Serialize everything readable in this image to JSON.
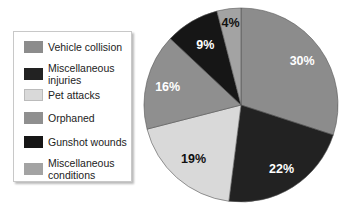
{
  "chart_data": {
    "type": "pie",
    "title": "",
    "categories": [
      "Vehicle collision",
      "Miscellaneous injuries",
      "Pet attacks",
      "Orphaned",
      "Gunshot wounds",
      "Miscellaneous conditions"
    ],
    "values": [
      30,
      22,
      19,
      16,
      9,
      4
    ],
    "labels": [
      "30%",
      "22%",
      "19%",
      "16%",
      "9%",
      "4%"
    ],
    "colors": [
      "#8c8c8c",
      "#222222",
      "#d9d9d9",
      "#8f8f8f",
      "#161616",
      "#a3a3a3"
    ],
    "label_colors": [
      "#ffffff",
      "#ffffff",
      "#111111",
      "#ffffff",
      "#ffffff",
      "#111111"
    ],
    "legend_position": "left",
    "start_angle_deg": 0,
    "direction": "clockwise"
  },
  "legend": {
    "items": [
      {
        "label": "Vehicle collision"
      },
      {
        "label": "Miscellaneous injuries"
      },
      {
        "label": "Pet attacks"
      },
      {
        "label": "Orphaned"
      },
      {
        "label": "Gunshot wounds"
      },
      {
        "label": "Miscellaneous conditions"
      }
    ]
  }
}
